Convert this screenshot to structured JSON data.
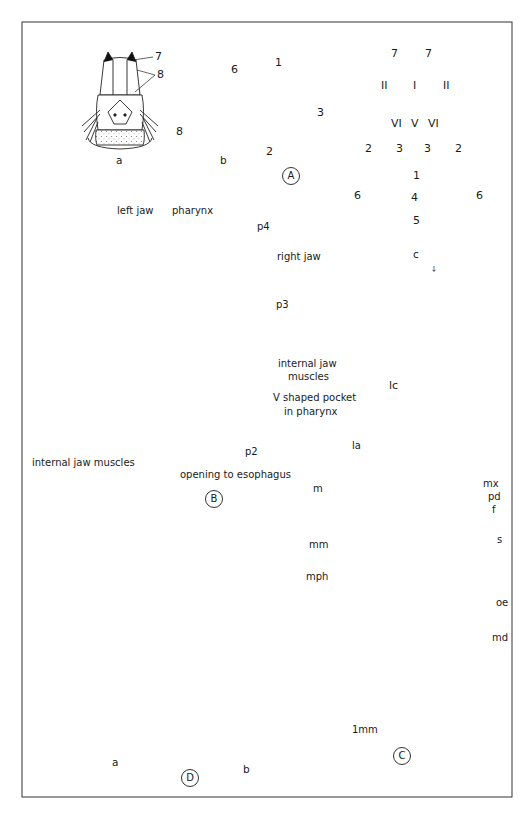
{
  "figure": {
    "panels": {
      "A": {
        "id": "A",
        "subfigures": {
          "a": {
            "label": "a",
            "callouts": [
              "7",
              "8"
            ]
          },
          "b": {
            "label": "b",
            "callouts": [
              "6",
              "1",
              "3",
              "8",
              "2"
            ]
          },
          "c": {
            "label": "c",
            "regions": [
              "7",
              "7",
              "II",
              "I",
              "II",
              "VI",
              "V",
              "VI",
              "2",
              "3",
              "3",
              "2",
              "1",
              "6",
              "4",
              "6",
              "5"
            ],
            "stray_mark": "⸸"
          }
        }
      },
      "B": {
        "id": "B",
        "labels": {
          "left_jaw": "left jaw",
          "pharynx": "pharynx",
          "p4": "p4",
          "right_jaw": "right jaw",
          "p3": "p3",
          "internal_jaw_muscles_right_line1": "internal jaw",
          "internal_jaw_muscles_right_line2": "muscles",
          "v_pocket_line1": "V shaped pocket",
          "v_pocket_line2": "in pharynx",
          "p2": "p2",
          "internal_jaw_muscles_left": "internal jaw muscles",
          "opening": "opening to esophagus"
        }
      },
      "C": {
        "id": "C",
        "labels": [
          "lc",
          "la",
          "m",
          "mx",
          "pd",
          "f",
          "mm",
          "s",
          "mph",
          "oe",
          "md"
        ],
        "scale_bar": "1mm"
      },
      "D": {
        "id": "D",
        "subfigures": {
          "a": {
            "label": "a"
          },
          "b": {
            "label": "b"
          }
        }
      }
    }
  }
}
